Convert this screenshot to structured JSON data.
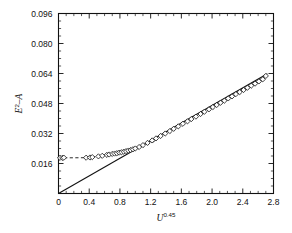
{
  "chart_data": {
    "type": "scatter",
    "title": "",
    "subtitle": "",
    "xlabel": "U",
    "xlabel_exponent": "0.45",
    "ylabel": "E",
    "ylabel_exponent": "2",
    "ylabel_suffix": "–A",
    "xlim": [
      0,
      2.8
    ],
    "ylim": [
      0,
      0.096
    ],
    "xticks": [
      0,
      0.4,
      0.8,
      1.2,
      1.6,
      2.0,
      2.4,
      2.8
    ],
    "xtick_labels": [
      "0",
      "0.4",
      "0.8",
      "1.2",
      "1.6",
      "2.0",
      "2.4",
      "2.8"
    ],
    "yticks": [
      0.016,
      0.032,
      0.048,
      0.064,
      0.08,
      0.096
    ],
    "ytick_labels": [
      "0.016",
      "0.032",
      "0.048",
      "0.064",
      "0.080",
      "0.096"
    ],
    "ytick_minor_step": 0.004,
    "xtick_minor_step": 0.1,
    "grid": false,
    "legend": "none",
    "marker_style": "open-diamond",
    "series": [
      {
        "name": "measured",
        "marker": "open-diamond",
        "x": [
          0.02,
          0.05,
          0.07,
          0.36,
          0.41,
          0.44,
          0.52,
          0.57,
          0.63,
          0.66,
          0.7,
          0.73,
          0.76,
          0.79,
          0.82,
          0.85,
          0.88,
          0.91,
          0.94,
          0.97,
          1.0,
          1.05,
          1.1,
          1.16,
          1.22,
          1.27,
          1.33,
          1.39,
          1.45,
          1.5,
          1.56,
          1.62,
          1.68,
          1.73,
          1.79,
          1.85,
          1.9,
          1.96,
          2.01,
          2.06,
          2.11,
          2.16,
          2.21,
          2.26,
          2.31,
          2.36,
          2.41,
          2.46,
          2.51,
          2.56,
          2.61,
          2.66,
          2.7
        ],
        "y": [
          0.019,
          0.019,
          0.0191,
          0.0191,
          0.0192,
          0.0194,
          0.0198,
          0.0201,
          0.0206,
          0.0208,
          0.0211,
          0.0213,
          0.0215,
          0.0218,
          0.022,
          0.0223,
          0.0226,
          0.0229,
          0.0232,
          0.0236,
          0.024,
          0.0248,
          0.0258,
          0.027,
          0.0283,
          0.0294,
          0.0307,
          0.032,
          0.0333,
          0.0345,
          0.0358,
          0.0372,
          0.0385,
          0.0397,
          0.041,
          0.0424,
          0.0436,
          0.0449,
          0.0461,
          0.0472,
          0.0484,
          0.0495,
          0.0507,
          0.0518,
          0.053,
          0.0541,
          0.0552,
          0.0564,
          0.0575,
          0.0586,
          0.0598,
          0.0609,
          0.0627
        ]
      }
    ],
    "annotations": [
      {
        "name": "solid-fit-line",
        "type": "line",
        "style": "solid",
        "x": [
          0.0,
          2.72
        ],
        "y": [
          0.0,
          0.0639
        ]
      },
      {
        "name": "dashed-plateau-line",
        "type": "line",
        "style": "dashed",
        "x": [
          0.0,
          0.4,
          0.7,
          1.0,
          1.25
        ],
        "y": [
          0.019,
          0.0191,
          0.0211,
          0.024,
          0.0278
        ]
      }
    ]
  }
}
